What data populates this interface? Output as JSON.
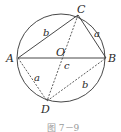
{
  "figure": {
    "caption": "图 7－9",
    "circle": {
      "cx": 61,
      "cy": 58,
      "r": 44,
      "center_label": "O"
    },
    "points": {
      "A": {
        "label": "A",
        "x": 18,
        "y": 58
      },
      "B": {
        "label": "B",
        "x": 106,
        "y": 58
      },
      "C": {
        "label": "C",
        "x": 78,
        "y": 15
      },
      "D": {
        "label": "D",
        "x": 47,
        "y": 101
      },
      "O": {
        "label": "O",
        "x": 63,
        "y": 58
      }
    },
    "solid_segments": [
      "AC",
      "CB",
      "AB"
    ],
    "dashed_segments": [
      "AD",
      "DB",
      "CD"
    ],
    "segment_labels": {
      "AC": "b",
      "CB": "a",
      "AB": "c",
      "AD": "a",
      "DB": "b"
    },
    "colors": {
      "stroke": "#333333",
      "caption": "#9a9a9a"
    }
  }
}
